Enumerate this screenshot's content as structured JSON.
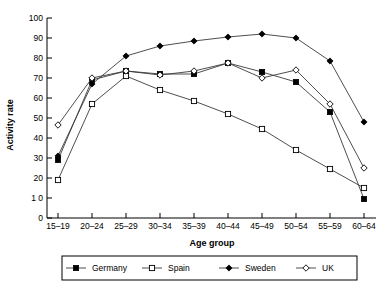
{
  "chart_data": {
    "type": "line",
    "title": "",
    "xlabel": "Age group",
    "ylabel": "Activity rate",
    "categories": [
      "15–19",
      "20–24",
      "25–29",
      "30–34",
      "35–39",
      "40–44",
      "45–49",
      "50–54",
      "55–59",
      "60–64"
    ],
    "ylim": [
      0,
      100
    ],
    "yticks": [
      0,
      10,
      20,
      30,
      40,
      50,
      60,
      70,
      80,
      90,
      100
    ],
    "ytick_labels": [
      "0",
      "1 0",
      "20",
      "30",
      "40",
      "50",
      "60",
      "70",
      "80",
      "90",
      "100"
    ],
    "grid": false,
    "legend_position": "bottom",
    "series": [
      {
        "name": "Germany",
        "marker": "filled-square",
        "values": [
          29,
          69,
          73.5,
          72,
          72,
          77.5,
          73,
          68,
          53,
          9.5
        ]
      },
      {
        "name": "Spain",
        "marker": "open-square",
        "values": [
          19,
          57,
          71,
          64,
          58.5,
          52,
          44.5,
          34,
          24.5,
          15
        ]
      },
      {
        "name": "Sweden",
        "marker": "filled-diamond",
        "values": [
          31,
          67,
          81,
          86,
          88.5,
          90.5,
          92,
          90,
          78.5,
          48
        ]
      },
      {
        "name": "UK",
        "marker": "open-diamond",
        "values": [
          46.5,
          70,
          73.5,
          71.5,
          73.5,
          77.5,
          70,
          74,
          57,
          25
        ]
      }
    ]
  },
  "axes": {
    "ylabel": "Activity rate",
    "xlabel": "Age group"
  },
  "legend": {
    "items": [
      {
        "label": "Germany",
        "marker": "filled-square"
      },
      {
        "label": "Spain",
        "marker": "open-square"
      },
      {
        "label": "Sweden",
        "marker": "filled-diamond"
      },
      {
        "label": "UK",
        "marker": "open-diamond"
      }
    ]
  },
  "colors": {
    "line": "#3a3a3a",
    "axis": "#000000",
    "marker_fill": "#000000",
    "marker_open_fill": "#ffffff",
    "background": "#ffffff"
  }
}
